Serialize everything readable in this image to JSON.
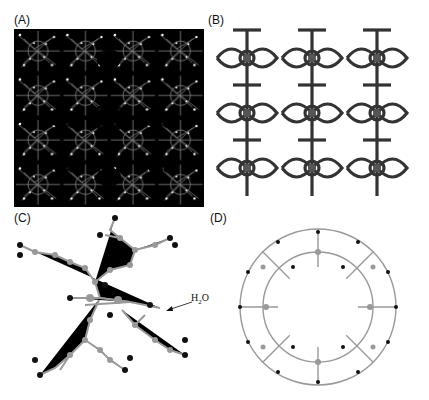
{
  "figure": {
    "panels": [
      {
        "label": "(A)",
        "description": "packing view of framework, white atoms on black background"
      },
      {
        "label": "(B)",
        "description": "3D framework network, dark gray"
      },
      {
        "label": "(C)",
        "description": "coordination environment ball-and-stick"
      },
      {
        "label": "(D)",
        "description": "ring-shaped cage with open pore"
      }
    ],
    "annotation": {
      "text_main": "H",
      "text_sub": "2",
      "text_end": "O"
    },
    "colors": {
      "bg_a": "#000000",
      "net_b": "#3a3a3a",
      "atom_gray": "#999999",
      "atom_black": "#111111"
    }
  }
}
